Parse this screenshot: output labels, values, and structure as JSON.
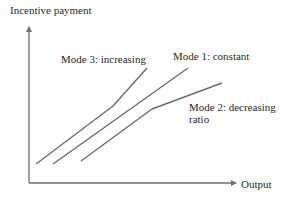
{
  "diagram": {
    "axes": {
      "y_label": "Incentive payment",
      "x_label": "Output",
      "color": "#6e6e6e"
    },
    "lines": [
      {
        "id": "mode3",
        "label": "Mode 3: increasing",
        "shape": "piecewise linear, slope increases after kink",
        "points": [
          [
            36,
            164
          ],
          [
            113,
            106
          ],
          [
            147,
            68
          ]
        ]
      },
      {
        "id": "mode1",
        "label": "Mode 1: constant",
        "shape": "straight line, constant slope",
        "points": [
          [
            53,
            164
          ],
          [
            188,
            68
          ]
        ]
      },
      {
        "id": "mode2",
        "label_line1": "Mode 2: decreasing",
        "label_line2": "ratio",
        "shape": "piecewise linear, slope decreases after kink",
        "points": [
          [
            81,
            161
          ],
          [
            152,
            109
          ],
          [
            222,
            83
          ]
        ]
      }
    ],
    "line_color": "#6b6b6b"
  }
}
